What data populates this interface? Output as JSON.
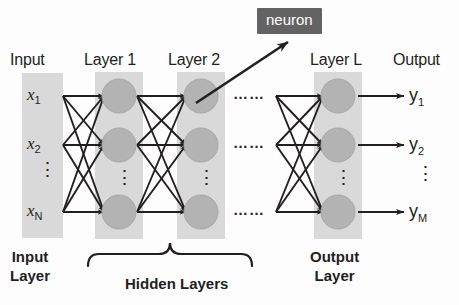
{
  "diagram": {
    "title_row": {
      "input": "Input",
      "layer1": "Layer 1",
      "layer2": "Layer 2",
      "layerL": "Layer L",
      "output": "Output"
    },
    "callout": {
      "label": "neuron"
    },
    "inputs": [
      {
        "base": "x",
        "sub": "1"
      },
      {
        "base": "x",
        "sub": "2"
      },
      {
        "base": "x",
        "sub": "N"
      }
    ],
    "input_vdots": "⋮",
    "outputs": [
      {
        "base": "y",
        "sub": "1"
      },
      {
        "base": "y",
        "sub": "2"
      },
      {
        "base": "y",
        "sub": "M"
      }
    ],
    "output_vdots": "⋮",
    "column_vdots": "⋮",
    "row_hdots": "……",
    "footers": {
      "input_layer_l1": "Input",
      "input_layer_l2": "Layer",
      "hidden_layers": "Hidden Layers",
      "output_layer_l1": "Output",
      "output_layer_l2": "Layer"
    },
    "colors": {
      "band": "#d9d9d9",
      "node": "#b3b3b3",
      "node_stroke": "#a6a6a6",
      "edge": "#231f20",
      "callout_bg": "#636363",
      "callout_text": "#ffffff",
      "text": "#231f20",
      "background": "#fdfdfd"
    },
    "geometry": {
      "rows_y": [
        96,
        145,
        212
      ],
      "columns_x": [
        42,
        119,
        201,
        338
      ],
      "node_radius": 17
    }
  }
}
